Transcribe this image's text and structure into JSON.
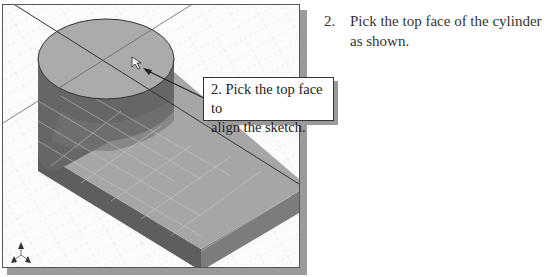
{
  "instruction": {
    "number": "2.",
    "line1": "Pick the top face of the cylinder",
    "line2": "as shown."
  },
  "callout": {
    "line1": "2. Pick the top face to",
    "line2": "align the sketch."
  },
  "viewport": {
    "model": "cylinder-on-block",
    "highlighted_face": "cylinder-top-face",
    "colors": {
      "face_top": "#a9a9a9",
      "face_dark": "#5e5e5e",
      "face_mid": "#7a7a7a",
      "background": "#fbfbfb",
      "shadow": "#9a9a9a"
    }
  }
}
